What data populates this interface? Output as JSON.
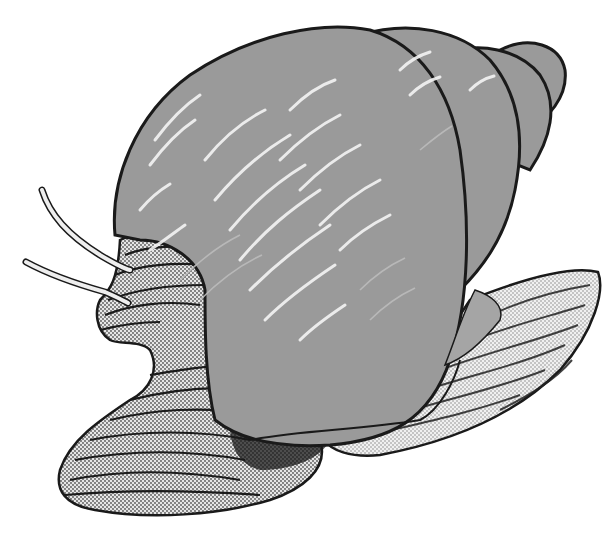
{
  "image": {
    "subject": "Snail illustration",
    "style": "grayscale pen-and-ink with halftone shading",
    "colors": {
      "background": "#ffffff",
      "shell": "#9a9a9a",
      "shell_highlight": "#f4f4f4",
      "outline": "#1a1a1a",
      "body_halftone": "#b8b8b8",
      "body_stripe": "#222222"
    }
  }
}
